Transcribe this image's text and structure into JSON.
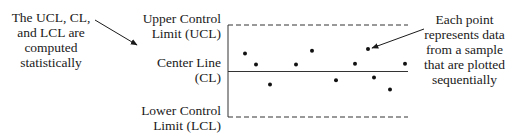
{
  "left_note": {
    "lines": [
      "The UCL, CL,",
      "and LCL are",
      "computed",
      "statistically"
    ]
  },
  "labels": {
    "ucl": [
      "Upper Control",
      "Limit (UCL)"
    ],
    "cl": [
      "Center Line",
      "(CL)"
    ],
    "lcl": [
      "Lower Control",
      "Limit (LCL)"
    ]
  },
  "right_note": {
    "lines": [
      "Each point",
      "represents data",
      "from a sample",
      "that are plotted",
      "sequentially"
    ]
  },
  "chart_data": {
    "type": "scatter",
    "title": "",
    "xlabel": "",
    "ylabel": "",
    "reference_lines": [
      {
        "name": "Upper Control Limit (UCL)",
        "style": "dashed",
        "value": 1.0
      },
      {
        "name": "Center Line (CL)",
        "style": "solid",
        "value": 0.0
      },
      {
        "name": "Lower Control Limit (LCL)",
        "style": "dashed",
        "value": -1.0
      }
    ],
    "x": [
      1,
      2,
      3,
      4,
      5,
      6,
      7,
      8,
      9,
      10,
      11
    ],
    "y": [
      0.39,
      0.15,
      -0.28,
      0.15,
      0.45,
      -0.19,
      0.17,
      0.49,
      -0.13,
      -0.39,
      0.17
    ],
    "ylim": [
      -1.0,
      1.0
    ],
    "grid": false,
    "legend": null
  }
}
